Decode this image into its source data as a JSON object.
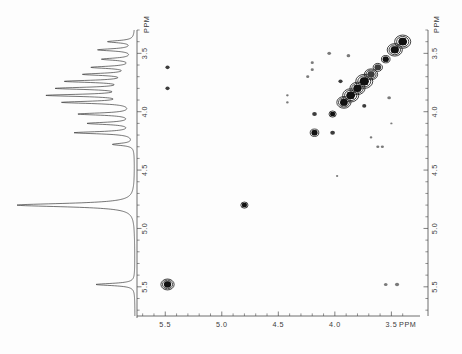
{
  "figure": {
    "kind": "2d-cosy-nmr-spectrum",
    "background_color": "#fdfdfd",
    "ink_color": "#111111",
    "axis_color": "#4a4a4a"
  },
  "axes": {
    "f2_bottom": {
      "name": "bottom-horizontal-axis",
      "unit_label": "PPM",
      "tick_labels": [
        "5.5",
        "5.0",
        "4.5",
        "4.0",
        "3.5"
      ],
      "tick_values": [
        5.5,
        5.0,
        4.5,
        4.0,
        3.5
      ],
      "range": [
        5.75,
        3.3
      ],
      "direction": "decreasing-left-to-right",
      "minor_tick_step": 0.1
    },
    "f1_right": {
      "name": "right-vertical-axis",
      "unit_label": "PPM",
      "tick_labels": [
        "3.5",
        "4.0",
        "4.5",
        "5.0",
        "5.5"
      ],
      "tick_values": [
        3.5,
        4.0,
        4.5,
        5.0,
        5.5
      ],
      "range": [
        3.3,
        5.75
      ],
      "direction": "increasing-top-to-bottom",
      "minor_tick_step": 0.1
    },
    "f1_left": {
      "name": "left-vertical-axis",
      "unit_label": "PPM",
      "tick_labels": [
        "3.5",
        "4.0",
        "4.5",
        "5.0",
        "5.5"
      ],
      "tick_values": [
        3.5,
        4.0,
        4.5,
        5.0,
        5.5
      ],
      "range": [
        3.3,
        5.75
      ],
      "direction": "increasing-top-to-bottom",
      "minor_tick_step": 0.1
    }
  },
  "chart_data": {
    "type": "scatter",
    "title": "",
    "subtitle": "",
    "xlabel": "PPM",
    "ylabel": "PPM",
    "xlim": [
      5.75,
      3.3
    ],
    "ylim": [
      5.75,
      3.3
    ],
    "grid": false,
    "legend": "none",
    "diagonal_peaks": [
      {
        "f2": 5.48,
        "f1": 5.48,
        "size": 7.0,
        "intensity": "strong"
      },
      {
        "f2": 4.8,
        "f1": 4.8,
        "size": 5.0,
        "intensity": "strong"
      },
      {
        "f2": 4.18,
        "f1": 4.18,
        "size": 6.0,
        "intensity": "strong"
      },
      {
        "f2": 4.02,
        "f1": 4.02,
        "size": 5.0,
        "intensity": "strong"
      },
      {
        "f2": 3.92,
        "f1": 3.92,
        "size": 7.5,
        "intensity": "strong"
      },
      {
        "f2": 3.86,
        "f1": 3.86,
        "size": 8.5,
        "intensity": "strong"
      },
      {
        "f2": 3.8,
        "f1": 3.8,
        "size": 8.0,
        "intensity": "strong"
      },
      {
        "f2": 3.74,
        "f1": 3.74,
        "size": 9.0,
        "intensity": "strong"
      },
      {
        "f2": 3.68,
        "f1": 3.68,
        "size": 7.0,
        "intensity": "medium"
      },
      {
        "f2": 3.62,
        "f1": 3.62,
        "size": 6.5,
        "intensity": "medium"
      },
      {
        "f2": 3.55,
        "f1": 3.55,
        "size": 6.0,
        "intensity": "strong"
      },
      {
        "f2": 3.47,
        "f1": 3.47,
        "size": 8.0,
        "intensity": "strong"
      },
      {
        "f2": 3.4,
        "f1": 3.4,
        "size": 8.5,
        "intensity": "strong"
      }
    ],
    "cross_peaks": [
      {
        "f2": 5.48,
        "f1": 3.62,
        "size": 4.0,
        "intensity": "medium"
      },
      {
        "f2": 5.48,
        "f1": 3.8,
        "size": 4.0,
        "intensity": "medium"
      },
      {
        "f2": 4.2,
        "f1": 3.58,
        "size": 3.0,
        "intensity": "weak"
      },
      {
        "f2": 4.2,
        "f1": 3.64,
        "size": 3.0,
        "intensity": "weak"
      },
      {
        "f2": 4.24,
        "f1": 3.7,
        "size": 3.0,
        "intensity": "weak"
      },
      {
        "f2": 4.05,
        "f1": 3.5,
        "size": 3.5,
        "intensity": "weak"
      },
      {
        "f2": 4.18,
        "f1": 4.02,
        "size": 4.5,
        "intensity": "medium"
      },
      {
        "f2": 4.02,
        "f1": 4.18,
        "size": 4.5,
        "intensity": "medium"
      },
      {
        "f2": 3.95,
        "f1": 3.74,
        "size": 4.0,
        "intensity": "medium"
      },
      {
        "f2": 3.74,
        "f1": 3.95,
        "size": 4.0,
        "intensity": "medium"
      },
      {
        "f2": 3.88,
        "f1": 3.52,
        "size": 3.5,
        "intensity": "weak"
      },
      {
        "f2": 3.52,
        "f1": 3.88,
        "size": 3.5,
        "intensity": "weak"
      },
      {
        "f2": 3.58,
        "f1": 4.3,
        "size": 3.0,
        "intensity": "weak"
      },
      {
        "f2": 3.62,
        "f1": 4.3,
        "size": 3.0,
        "intensity": "weak"
      },
      {
        "f2": 3.55,
        "f1": 5.48,
        "size": 3.5,
        "intensity": "weak"
      },
      {
        "f2": 3.45,
        "f1": 5.48,
        "size": 4.0,
        "intensity": "weak"
      },
      {
        "f2": 4.42,
        "f1": 3.92,
        "size": 2.5,
        "intensity": "weak"
      },
      {
        "f2": 4.42,
        "f1": 3.86,
        "size": 2.5,
        "intensity": "weak"
      },
      {
        "f2": 3.68,
        "f1": 4.22,
        "size": 2.5,
        "intensity": "weak"
      },
      {
        "f2": 3.98,
        "f1": 4.55,
        "size": 2.2,
        "intensity": "weak"
      },
      {
        "f2": 3.5,
        "f1": 4.1,
        "size": 2.2,
        "intensity": "weak"
      }
    ],
    "projection_1d": {
      "name": "f1-projection-trace",
      "orientation": "vertical-left-of-plot",
      "peaks": [
        {
          "ppm": 3.4,
          "height": 0.22
        },
        {
          "ppm": 3.47,
          "height": 0.3
        },
        {
          "ppm": 3.55,
          "height": 0.26
        },
        {
          "ppm": 3.62,
          "height": 0.34
        },
        {
          "ppm": 3.68,
          "height": 0.4
        },
        {
          "ppm": 3.74,
          "height": 0.55
        },
        {
          "ppm": 3.8,
          "height": 0.62
        },
        {
          "ppm": 3.86,
          "height": 0.7
        },
        {
          "ppm": 3.92,
          "height": 0.58
        },
        {
          "ppm": 4.02,
          "height": 0.46
        },
        {
          "ppm": 4.1,
          "height": 0.38
        },
        {
          "ppm": 4.18,
          "height": 0.5
        },
        {
          "ppm": 4.28,
          "height": 0.18
        },
        {
          "ppm": 4.8,
          "height": 1.0
        },
        {
          "ppm": 5.48,
          "height": 0.33
        }
      ]
    }
  }
}
